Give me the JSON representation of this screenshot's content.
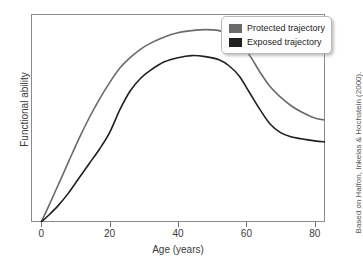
{
  "chart_data": {
    "type": "line",
    "title": "",
    "xlabel": "Age (years)",
    "ylabel": "Functional ability",
    "xlim": [
      -3,
      83
    ],
    "ylim": [
      0,
      1
    ],
    "xticks": [
      0,
      20,
      40,
      60,
      80
    ],
    "xtick_labels": [
      "0",
      "20",
      "40",
      "60",
      "80"
    ],
    "yticks": [],
    "ytick_labels": [],
    "grid": false,
    "legend_position": "top-right",
    "annotation": "Based on Halfon, Inkelas & Hochstein (2000).",
    "series": [
      {
        "name": "Protected trajectory",
        "color": "#6a6a6a",
        "x": [
          0,
          2,
          5,
          8,
          11,
          14,
          17,
          20,
          23,
          26,
          29,
          32,
          36,
          40,
          44,
          48,
          52,
          55,
          58,
          61,
          64,
          67,
          70,
          73,
          76,
          80,
          83
        ],
        "y": [
          0.0,
          0.07,
          0.18,
          0.29,
          0.4,
          0.5,
          0.59,
          0.67,
          0.74,
          0.79,
          0.83,
          0.86,
          0.89,
          0.91,
          0.92,
          0.925,
          0.92,
          0.9,
          0.86,
          0.8,
          0.72,
          0.65,
          0.6,
          0.56,
          0.53,
          0.5,
          0.49
        ]
      },
      {
        "name": "Exposed trajectory",
        "color": "#1f1f1f",
        "x": [
          0,
          2,
          5,
          8,
          11,
          14,
          17,
          20,
          23,
          26,
          29,
          32,
          36,
          40,
          44,
          48,
          52,
          55,
          58,
          61,
          64,
          67,
          70,
          73,
          76,
          80,
          83
        ],
        "y": [
          0.0,
          0.03,
          0.08,
          0.14,
          0.21,
          0.28,
          0.35,
          0.43,
          0.54,
          0.63,
          0.69,
          0.73,
          0.77,
          0.79,
          0.8,
          0.795,
          0.78,
          0.75,
          0.7,
          0.62,
          0.54,
          0.47,
          0.43,
          0.41,
          0.4,
          0.39,
          0.385
        ]
      }
    ]
  },
  "legend": {
    "items": [
      {
        "label": "Protected trajectory",
        "color": "#6a6a6a"
      },
      {
        "label": "Exposed trajectory",
        "color": "#1f1f1f"
      }
    ]
  },
  "axes": {
    "x_title": "Age (years)",
    "y_title": "Functional ability",
    "x_tick_labels": [
      "0",
      "20",
      "40",
      "60",
      "80"
    ]
  },
  "credit": {
    "text": "Based on Halfon, Inkelas & Hochstein (2000)."
  }
}
